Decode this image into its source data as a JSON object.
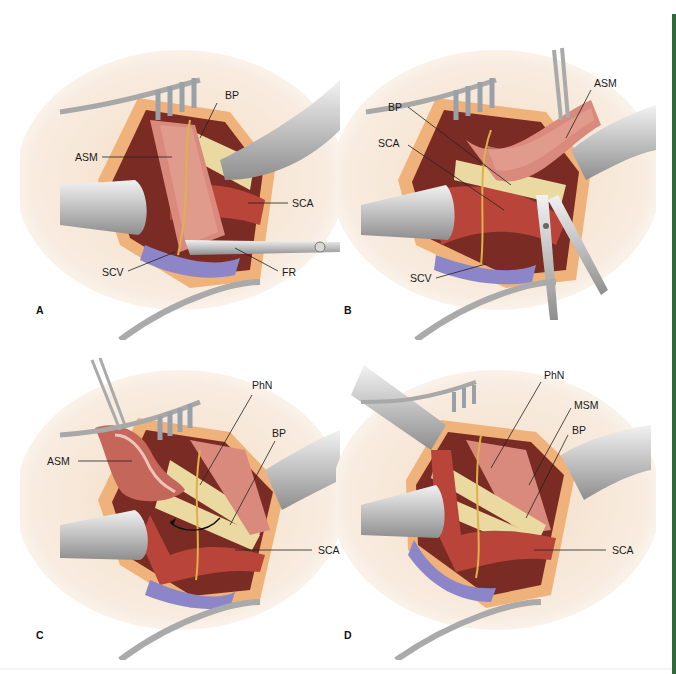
{
  "figure": {
    "accent_bar_color": "#2f6b3a",
    "panels": [
      {
        "id": "A",
        "letter": "A",
        "labels": [
          {
            "text": "BP"
          },
          {
            "text": "ASM"
          },
          {
            "text": "SCA"
          },
          {
            "text": "SCV"
          },
          {
            "text": "FR"
          }
        ]
      },
      {
        "id": "B",
        "letter": "B",
        "labels": [
          {
            "text": "ASM"
          },
          {
            "text": "BP"
          },
          {
            "text": "SCA"
          },
          {
            "text": "SCV"
          }
        ]
      },
      {
        "id": "C",
        "letter": "C",
        "labels": [
          {
            "text": "PhN"
          },
          {
            "text": "ASM"
          },
          {
            "text": "BP"
          },
          {
            "text": "SCA"
          }
        ]
      },
      {
        "id": "D",
        "letter": "D",
        "labels": [
          {
            "text": "PhN"
          },
          {
            "text": "MSM"
          },
          {
            "text": "BP"
          },
          {
            "text": "SCA"
          }
        ]
      }
    ],
    "colors": {
      "skin": "#f6e6d3",
      "fat": "#eeb27a",
      "muscle": "#c9776a",
      "muscle_light": "#e6a79a",
      "artery": "#b8443a",
      "vein": "#8c86c8",
      "nerve": "#ead9a0",
      "phrenic": "#e0b04a",
      "steel": "#c9c9c9",
      "steel_dark": "#8d8d8d"
    }
  }
}
